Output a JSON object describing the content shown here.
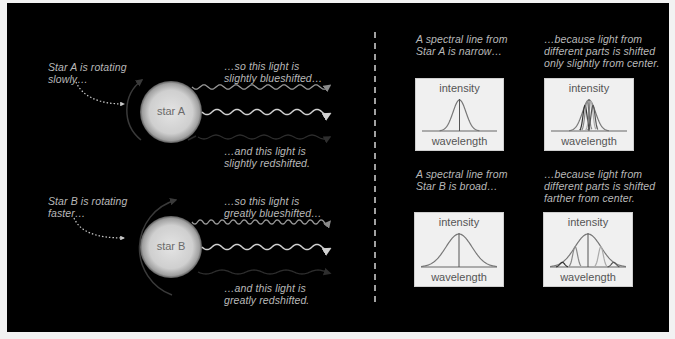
{
  "left": {
    "starA": {
      "label": "star A",
      "rotation_caption": [
        "Star A is rotating",
        "slowly…"
      ],
      "blue_caption": [
        "…so this light is",
        "slightly blueshifted…"
      ],
      "red_caption": [
        "…and this light is",
        "slightly redshifted."
      ]
    },
    "starB": {
      "label": "star B",
      "rotation_caption": [
        "Star B is rotating",
        "faster…"
      ],
      "blue_caption": [
        "…so this light is",
        "greatly blueshifted…"
      ],
      "red_caption": [
        "…and this light is",
        "greatly redshifted."
      ]
    }
  },
  "right": {
    "rowA": {
      "line_caption": [
        "A spectral line from",
        "Star A is narrow…"
      ],
      "reason_caption": [
        "…because light from",
        "different parts is shifted",
        "only slightly from center."
      ]
    },
    "rowB": {
      "line_caption": [
        "A spectral line from",
        "Star B is broad…"
      ],
      "reason_caption": [
        "…because light from",
        "different parts is shifted",
        "farther from center."
      ]
    },
    "axis": {
      "y_label": "intensity",
      "x_label": "wavelength"
    }
  },
  "colors": {
    "background": "#000000",
    "caption": "#b9b9b9",
    "star_center": "#e4e4e4",
    "star_edge": "#9a9a9a",
    "wave_blue": "#9a9a9a",
    "wave_center": "#d0d0d0",
    "wave_red": "#2e2e2e",
    "box_bg": "#f0f0f0",
    "curve": "#6a6a6a"
  }
}
